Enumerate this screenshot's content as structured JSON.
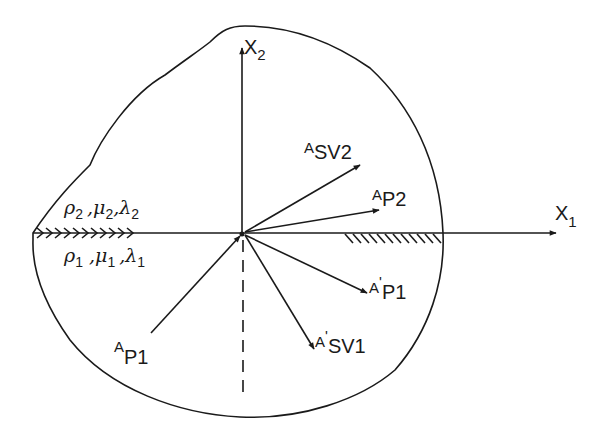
{
  "diagram": {
    "title": "",
    "axes": {
      "x1": {
        "label": "X",
        "subscript": "1"
      },
      "x2": {
        "label": "X",
        "subscript": "2"
      }
    },
    "media": {
      "upper": {
        "label_rho": "ρ",
        "sub_rho": "2",
        "label_mu": "μ",
        "sub_mu": "2",
        "label_lambda": "λ",
        "sub_lambda": "2",
        "sep": ","
      },
      "lower": {
        "label_rho": "ρ",
        "sub_rho": "1",
        "label_mu": "μ",
        "sub_mu": "1",
        "label_lambda": "λ",
        "sub_lambda": "1",
        "sep": ","
      }
    },
    "waves": {
      "incident_p1": {
        "label": "A",
        "subscript": "P1",
        "prime": ""
      },
      "reflected_p1": {
        "label": "A",
        "subscript": "P1",
        "prime": "'"
      },
      "reflected_sv1": {
        "label": "A",
        "subscript": "SV1",
        "prime": "'"
      },
      "transmitted_p2": {
        "label": "A",
        "subscript": "P2",
        "prime": ""
      },
      "transmitted_sv2": {
        "label": "A",
        "subscript": "SV2",
        "prime": ""
      }
    },
    "colors": {
      "ink": "#1a1a1a",
      "background": "#ffffff"
    }
  }
}
